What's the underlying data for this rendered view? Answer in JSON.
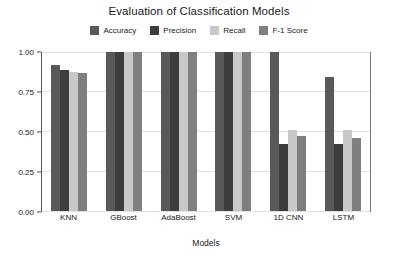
{
  "chart_data": {
    "type": "bar",
    "title": "Evaluation of Classification Models",
    "xlabel": "Models",
    "ylabel": "",
    "categories": [
      "KNN",
      "GBoost",
      "AdaBoost",
      "SVM",
      "1D CNN",
      "LSTM"
    ],
    "series": [
      {
        "name": "Accuracy",
        "color": "#595959",
        "values": [
          0.92,
          1.0,
          1.0,
          1.0,
          1.0,
          0.845
        ]
      },
      {
        "name": "Precision",
        "color": "#3d3d3d",
        "values": [
          0.885,
          1.0,
          1.0,
          1.0,
          0.42,
          0.42
        ]
      },
      {
        "name": "Recall",
        "color": "#c8c8c8",
        "values": [
          0.875,
          1.0,
          1.0,
          1.0,
          0.51,
          0.51
        ]
      },
      {
        "name": "F-1 Score",
        "color": "#7f7f7f",
        "values": [
          0.865,
          1.0,
          1.0,
          1.0,
          0.47,
          0.46
        ]
      }
    ],
    "ylim": [
      0.0,
      1.0
    ],
    "yticks": [
      "0.00",
      "0.25",
      "0.50",
      "0.75",
      "1.00"
    ],
    "ytick_values": [
      0.0,
      0.25,
      0.5,
      0.75,
      1.0
    ],
    "grid": true,
    "legend_position": "top-center"
  },
  "legend": {
    "items": [
      {
        "label": "Accuracy",
        "color": "#595959"
      },
      {
        "label": "Precision",
        "color": "#3d3d3d"
      },
      {
        "label": "Recall",
        "color": "#c8c8c8"
      },
      {
        "label": "F-1 Score",
        "color": "#7f7f7f"
      }
    ]
  }
}
